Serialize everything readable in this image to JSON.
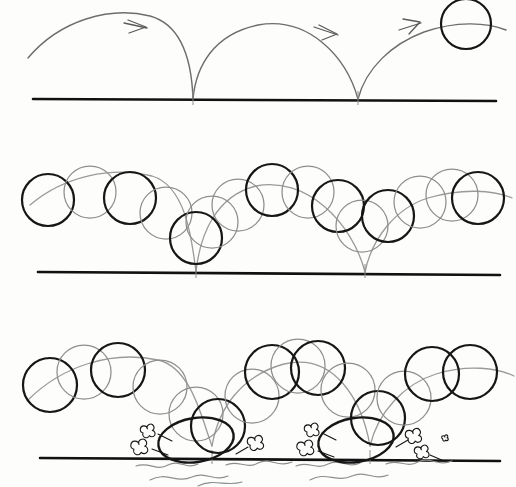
{
  "document": {
    "kind": "hand-drawn-animation-timing-sheet",
    "subject": "bouncing ball",
    "background_color": "#fdfdfc",
    "width": 516,
    "height": 487
  },
  "palette": {
    "ink_dark": "#161616",
    "ink_mid": "#555555",
    "ink_light": "#8e8e8e",
    "ink_very_light": "#a9a9a9",
    "ground": "#111111",
    "paper": "#fdfdfc"
  },
  "geometry": {
    "ball_radius_panel1": 26,
    "ball_radius_panel2": 26,
    "ball_radius_panel3": 27
  },
  "panels": [
    {
      "id": "panel-arc-path",
      "name": "arc-path-only",
      "label": "Path of action — arcs with direction arrows",
      "ground": {
        "x1": 33,
        "y1": 99,
        "x2": 496,
        "y2": 101,
        "width": 2.6
      },
      "ball": {
        "cx": 466,
        "cy": 24,
        "r": 25,
        "stroke": "#161616",
        "width": 2.2
      },
      "arcs": [
        {
          "name": "arc-1",
          "d": "M 28,58 C 60,20 110,6 150,16 C 186,26 192,70 193,99",
          "stroke": "#6d6d6d",
          "width": 1.4
        },
        {
          "name": "arc-2",
          "d": "M 193,99 C 196,66 214,34 258,25 C 308,16 346,56 358,99",
          "stroke": "#6d6d6d",
          "width": 1.4
        },
        {
          "name": "arc-3",
          "d": "M 358,99 C 366,68 392,44 424,32 C 456,21 486,22 506,30",
          "stroke": "#6d6d6d",
          "width": 1.4
        }
      ],
      "arrows": [
        {
          "name": "direction-arrow-1",
          "points": "128,20 146,27 129,33",
          "tail": "M 124,23 L 147,28",
          "stroke": "#5a5a5a"
        },
        {
          "name": "direction-arrow-2",
          "points": "319,25 337,34 322,40",
          "tail": "M 314,27 L 338,35",
          "stroke": "#5a5a5a"
        },
        {
          "name": "direction-arrow-3",
          "points": "403,19 420,22 409,34",
          "tail": "M 399,30 L 421,23",
          "stroke": "#5a5a5a"
        }
      ],
      "bounce_points": [
        193,
        358
      ]
    },
    {
      "id": "panel-spacing",
      "name": "spacing-chart-no-squash",
      "label": "Spacing chart — ball positions, even circles, no distortion",
      "ground": {
        "x1": 38,
        "y1": 272,
        "x2": 500,
        "y2": 275,
        "width": 2.6
      },
      "arcs": [
        {
          "name": "arc-1",
          "d": "M 30,205 C 64,176 112,166 152,176 C 186,186 192,240 196,272",
          "stroke": "#9a9a9a",
          "width": 1.3
        },
        {
          "name": "arc-2",
          "d": "M 196,272 C 200,234 216,196 256,186 C 306,176 352,222 365,272",
          "stroke": "#9a9a9a",
          "width": 1.3
        },
        {
          "name": "arc-3",
          "d": "M 365,272 C 372,238 396,208 428,198 C 462,188 494,190 512,198",
          "stroke": "#9a9a9a",
          "width": 1.3
        }
      ],
      "balls": [
        {
          "cx": 48,
          "cy": 200,
          "r": 26,
          "tone": "dark"
        },
        {
          "cx": 90,
          "cy": 192,
          "r": 26,
          "tone": "light"
        },
        {
          "cx": 130,
          "cy": 198,
          "r": 26,
          "tone": "dark"
        },
        {
          "cx": 166,
          "cy": 213,
          "r": 26,
          "tone": "light"
        },
        {
          "cx": 196,
          "cy": 238,
          "r": 26,
          "tone": "dark"
        },
        {
          "cx": 212,
          "cy": 222,
          "r": 26,
          "tone": "light"
        },
        {
          "cx": 238,
          "cy": 205,
          "r": 26,
          "tone": "light"
        },
        {
          "cx": 272,
          "cy": 190,
          "r": 26,
          "tone": "dark"
        },
        {
          "cx": 308,
          "cy": 192,
          "r": 26,
          "tone": "light"
        },
        {
          "cx": 338,
          "cy": 206,
          "r": 26,
          "tone": "dark"
        },
        {
          "cx": 362,
          "cy": 226,
          "r": 26,
          "tone": "light"
        },
        {
          "cx": 388,
          "cy": 216,
          "r": 26,
          "tone": "dark"
        },
        {
          "cx": 420,
          "cy": 202,
          "r": 26,
          "tone": "light"
        },
        {
          "cx": 452,
          "cy": 195,
          "r": 26,
          "tone": "light"
        },
        {
          "cx": 478,
          "cy": 198,
          "r": 26,
          "tone": "dark"
        }
      ],
      "bounce_points": [
        196,
        365
      ]
    },
    {
      "id": "panel-squash-stretch",
      "name": "squash-stretch-with-impact-fx",
      "label": "Squash and stretch — impact flattening with dust puffs and shock lines",
      "ground": {
        "x1": 40,
        "y1": 458,
        "x2": 500,
        "y2": 461,
        "width": 2.6
      },
      "arcs": [
        {
          "name": "arc-1",
          "d": "M 28,400 C 62,366 112,350 158,360 C 192,368 202,420 212,446",
          "stroke": "#9a9a9a",
          "width": 1.3
        },
        {
          "name": "arc-2",
          "d": "M 212,446 C 218,410 240,376 284,364 C 334,352 362,400 370,446",
          "stroke": "#9a9a9a",
          "width": 1.3
        },
        {
          "name": "arc-3",
          "d": "M 370,446 C 378,412 404,384 436,374 C 468,364 498,368 514,376",
          "stroke": "#9a9a9a",
          "width": 1.3
        }
      ],
      "balls": [
        {
          "cx": 50,
          "cy": 385,
          "r": 27,
          "tone": "dark",
          "shape": "circle"
        },
        {
          "cx": 84,
          "cy": 372,
          "r": 27,
          "tone": "light",
          "shape": "circle"
        },
        {
          "cx": 118,
          "cy": 370,
          "r": 27,
          "tone": "dark",
          "shape": "circle"
        },
        {
          "cx": 160,
          "cy": 387,
          "r": 27,
          "tone": "light",
          "shape": "circle"
        },
        {
          "cx": 196,
          "cy": 414,
          "r": 27,
          "tone": "light",
          "shape": "circle"
        },
        {
          "cx": 218,
          "cy": 426,
          "r": 27,
          "tone": "dark",
          "shape": "circle"
        },
        {
          "cx": 252,
          "cy": 396,
          "r": 27,
          "tone": "light",
          "shape": "circle"
        },
        {
          "cx": 272,
          "cy": 372,
          "r": 27,
          "tone": "dark",
          "shape": "circle"
        },
        {
          "cx": 298,
          "cy": 366,
          "r": 27,
          "tone": "light",
          "shape": "circle"
        },
        {
          "cx": 318,
          "cy": 368,
          "r": 27,
          "tone": "dark",
          "shape": "circle"
        },
        {
          "cx": 348,
          "cy": 390,
          "r": 27,
          "tone": "light",
          "shape": "circle"
        },
        {
          "cx": 378,
          "cy": 418,
          "r": 27,
          "tone": "dark",
          "shape": "circle"
        },
        {
          "cx": 404,
          "cy": 398,
          "r": 27,
          "tone": "light",
          "shape": "circle"
        },
        {
          "cx": 432,
          "cy": 374,
          "r": 27,
          "tone": "dark",
          "shape": "circle"
        },
        {
          "cx": 470,
          "cy": 372,
          "r": 27,
          "tone": "dark",
          "shape": "circle"
        }
      ],
      "squash_ellipses": [
        {
          "name": "squash-left",
          "cx": 196,
          "cy": 440,
          "rx": 38,
          "ry": 22,
          "rotate": -9,
          "tone": "dark"
        },
        {
          "name": "squash-right",
          "cx": 356,
          "cy": 440,
          "rx": 38,
          "ry": 22,
          "rotate": -9,
          "tone": "dark"
        }
      ],
      "impact_points": [
        212,
        370
      ],
      "dust_puffs": [
        {
          "cx": 150,
          "cy": 431,
          "s": 1.0
        },
        {
          "cx": 142,
          "cy": 447,
          "s": 1.15
        },
        {
          "cx": 258,
          "cy": 443,
          "s": 1.1
        },
        {
          "cx": 314,
          "cy": 430,
          "s": 1.0
        },
        {
          "cx": 308,
          "cy": 448,
          "s": 1.15
        },
        {
          "cx": 416,
          "cy": 436,
          "s": 1.1
        },
        {
          "cx": 424,
          "cy": 452,
          "s": 1.0
        },
        {
          "cx": 446,
          "cy": 438,
          "s": 0.45
        }
      ],
      "speed_streaks": [
        "M 158,434 L 172,441",
        "M 152,449 L 168,455",
        "M 248,447 L 236,454",
        "M 322,433 L 336,440",
        "M 318,451 L 334,457",
        "M 408,440 L 396,447",
        "M 430,455 L 444,461"
      ],
      "shock_lines": [
        "M 136,466 C 150,461 156,472 168,465 C 180,459 186,470 198,464",
        "M 150,480 C 166,471 176,484 192,477 C 206,471 214,482 228,476",
        "M 226,465 C 238,459 246,470 258,463 C 270,457 278,468 292,462",
        "M 198,486 C 214,478 226,487 242,482",
        "M 296,466 C 308,460 316,471 328,464 C 340,458 348,469 360,463",
        "M 310,480 C 326,471 336,483 352,476 C 366,470 374,481 388,475",
        "M 386,464 C 398,458 406,469 418,462 C 430,456 438,467 452,461"
      ]
    }
  ]
}
